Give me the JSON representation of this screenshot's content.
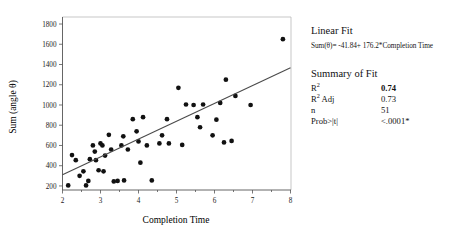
{
  "chart_data": {
    "type": "scatter",
    "title": "",
    "xlabel": "Completion Time",
    "ylabel": "Sum (angle θ)",
    "xlim": [
      2,
      8
    ],
    "ylim": [
      160,
      1820
    ],
    "xticks": [
      2,
      3,
      4,
      5,
      6,
      7,
      8
    ],
    "yticks": [
      200,
      400,
      600,
      800,
      1000,
      1200,
      1400,
      1600,
      1800
    ],
    "xtick_labels": [
      "2",
      "3",
      "4",
      "5",
      "6",
      "7",
      "8"
    ],
    "ytick_labels": [
      "200",
      "400",
      "600",
      "800",
      "1000",
      "1200",
      "1400",
      "1600",
      "1800"
    ],
    "grid": false,
    "legend": false,
    "series": [
      {
        "name": "observations",
        "marker": "filled-circle",
        "color": "#111111",
        "points": [
          [
            2.15,
            205
          ],
          [
            2.25,
            505
          ],
          [
            2.35,
            455
          ],
          [
            2.45,
            300
          ],
          [
            2.55,
            345
          ],
          [
            2.62,
            205
          ],
          [
            2.68,
            250
          ],
          [
            2.72,
            465
          ],
          [
            2.8,
            600
          ],
          [
            2.85,
            540
          ],
          [
            2.88,
            455
          ],
          [
            2.95,
            355
          ],
          [
            3.0,
            620
          ],
          [
            3.05,
            600
          ],
          [
            3.08,
            345
          ],
          [
            3.12,
            500
          ],
          [
            3.22,
            705
          ],
          [
            3.28,
            560
          ],
          [
            3.35,
            245
          ],
          [
            3.45,
            250
          ],
          [
            3.55,
            600
          ],
          [
            3.6,
            690
          ],
          [
            3.62,
            255
          ],
          [
            3.72,
            560
          ],
          [
            3.85,
            860
          ],
          [
            3.95,
            740
          ],
          [
            4.0,
            640
          ],
          [
            4.05,
            430
          ],
          [
            4.12,
            880
          ],
          [
            4.22,
            600
          ],
          [
            4.35,
            255
          ],
          [
            4.55,
            620
          ],
          [
            4.62,
            700
          ],
          [
            4.75,
            860
          ],
          [
            4.8,
            620
          ],
          [
            5.05,
            1170
          ],
          [
            5.15,
            605
          ],
          [
            5.25,
            1005
          ],
          [
            5.45,
            1000
          ],
          [
            5.55,
            880
          ],
          [
            5.62,
            780
          ],
          [
            5.7,
            1005
          ],
          [
            5.95,
            700
          ],
          [
            6.05,
            855
          ],
          [
            6.15,
            1020
          ],
          [
            6.25,
            630
          ],
          [
            6.3,
            1250
          ],
          [
            6.45,
            645
          ],
          [
            6.55,
            1090
          ],
          [
            6.95,
            1000
          ],
          [
            7.8,
            1650
          ]
        ]
      }
    ],
    "fit_line": {
      "name": "Linear Fit",
      "color": "#4a4a4a",
      "slope": 176.2,
      "intercept": -41.84,
      "x_start": 2.0,
      "x_end": 8.0,
      "y_start": 310.56,
      "y_end": 1367.76
    }
  },
  "stats_panel": {
    "fit_heading": "Linear Fit",
    "equation": "Sum(θ)= -41.84+ 176.2*Completion Time",
    "summary_heading": "Summary of Fit",
    "rows": [
      {
        "label_main": "R",
        "label_sup": "2",
        "label_rest": "",
        "value": "0.74",
        "emphatic": true
      },
      {
        "label_main": "R",
        "label_sup": "2",
        "label_rest": " Adj",
        "value": "0.73",
        "emphatic": false
      },
      {
        "label_main": "n",
        "label_sup": "",
        "label_rest": "",
        "value": "51",
        "emphatic": false
      },
      {
        "label_main": "Prob>|t|",
        "label_sup": "",
        "label_rest": "",
        "value": "<.0001*",
        "emphatic": false
      }
    ]
  }
}
